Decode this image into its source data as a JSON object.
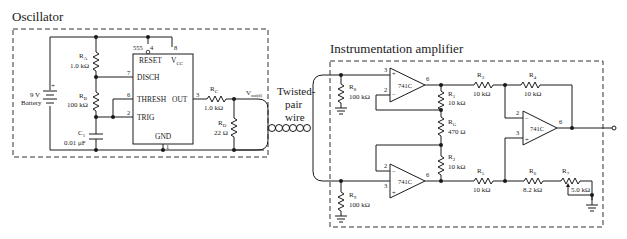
{
  "oscillator": {
    "title": "Oscillator",
    "battery": {
      "value": "9 V",
      "label": "Battery",
      "plus": "+"
    },
    "ra": {
      "name": "R",
      "sub": "A",
      "value": "1.0 kΩ"
    },
    "rb": {
      "name": "R",
      "sub": "B",
      "value": "100 kΩ"
    },
    "c1": {
      "name": "C",
      "sub": "1",
      "value": "0.01 μF"
    },
    "rc": {
      "name": "R",
      "sub": "C",
      "value": "1.0 kΩ"
    },
    "rd": {
      "name": "R",
      "sub": "D",
      "value": "22 Ω"
    },
    "ic": {
      "part": "555",
      "reset": "RESET",
      "vcc": "V",
      "vcc_sub": "CC",
      "disch": "DISCH",
      "thresh": "THRESH",
      "trig": "TRIG",
      "out": "OUT",
      "gnd": "GND",
      "pins": {
        "reset": "4",
        "vcc": "8",
        "disch": "7",
        "thresh": "6",
        "trig": "2",
        "out": "3",
        "gnd": "1"
      }
    },
    "vout": {
      "name": "V",
      "sub": "out(d)"
    }
  },
  "cable": {
    "line1": "Twisted-",
    "line2": "pair",
    "line3": "wire"
  },
  "amplifier": {
    "title": "Instrumentation amplifier",
    "opamp_part": "741C",
    "r8": {
      "name": "R",
      "sub": "8",
      "value": "100 kΩ"
    },
    "r9": {
      "name": "R",
      "sub": "9",
      "value": "100 kΩ"
    },
    "r1": {
      "name": "R",
      "sub": "1",
      "value": "10 kΩ"
    },
    "rg": {
      "name": "R",
      "sub": "G",
      "value": "470 Ω"
    },
    "r2": {
      "name": "R",
      "sub": "2",
      "value": "10 kΩ"
    },
    "r3": {
      "name": "R",
      "sub": "3",
      "value": "10 kΩ"
    },
    "r4": {
      "name": "R",
      "sub": "4",
      "value": "10 kΩ"
    },
    "r5": {
      "name": "R",
      "sub": "5",
      "value": "10 kΩ"
    },
    "r6": {
      "name": "R",
      "sub": "6",
      "value": "8.2 kΩ"
    },
    "r7": {
      "name": "R",
      "sub": "7",
      "value": "5.0 kΩ"
    },
    "pins": {
      "plus": "3",
      "minus": "2",
      "out": "6",
      "plus_sign": "+",
      "minus_sign": "−"
    }
  }
}
